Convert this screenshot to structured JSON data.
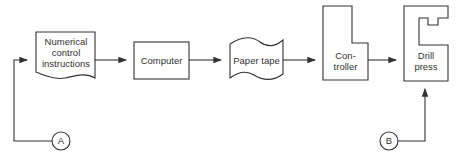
{
  "diagram": {
    "nodes": [
      {
        "id": "nc",
        "label_lines": [
          "Numerical",
          "control",
          "instructions"
        ],
        "shape": "document"
      },
      {
        "id": "computer",
        "label_lines": [
          "Computer"
        ],
        "shape": "rectangle"
      },
      {
        "id": "tape",
        "label_lines": [
          "Paper tape"
        ],
        "shape": "punched-tape"
      },
      {
        "id": "controller",
        "label_lines": [
          "Con-",
          "troller"
        ],
        "shape": "notched-box"
      },
      {
        "id": "drill",
        "label_lines": [
          "Drill",
          "press"
        ],
        "shape": "c-frame-box"
      }
    ],
    "connectors": [
      {
        "id": "A",
        "label": "A"
      },
      {
        "id": "B",
        "label": "B"
      }
    ],
    "edges": [
      {
        "from": "A",
        "to": "nc"
      },
      {
        "from": "nc",
        "to": "computer"
      },
      {
        "from": "computer",
        "to": "tape"
      },
      {
        "from": "tape",
        "to": "controller"
      },
      {
        "from": "controller",
        "to": "drill"
      },
      {
        "from": "B",
        "to": "drill"
      }
    ],
    "colors": {
      "stroke": "#333333",
      "text": "#333333",
      "background": "#ffffff"
    }
  }
}
